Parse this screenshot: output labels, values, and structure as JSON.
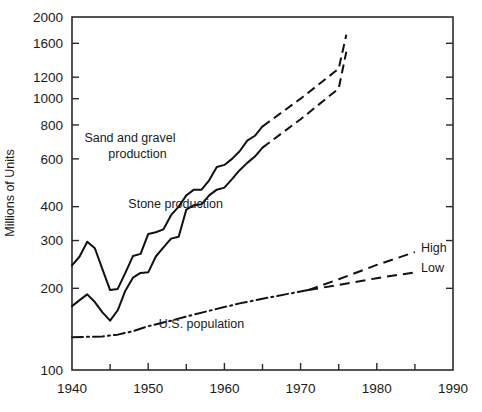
{
  "chart_data": {
    "type": "line",
    "title": "",
    "xlabel": "",
    "ylabel": "Millions of Units",
    "xlim": [
      1940,
      1990
    ],
    "ylim": [
      100,
      2000
    ],
    "yscale": "log",
    "grid": false,
    "legend_position": "inline-annotations",
    "x_ticks_major": [
      1940,
      1950,
      1960,
      1970,
      1980,
      1990
    ],
    "x_ticks_minor": [
      1945,
      1955,
      1965,
      1975,
      1985
    ],
    "x_tick_labels": [
      "1940",
      "1950",
      "1960",
      "1970",
      "1980",
      "1990"
    ],
    "y_ticks": [
      100,
      200,
      300,
      400,
      600,
      800,
      1000,
      1200,
      1600,
      2000
    ],
    "y_tick_labels": [
      "100",
      "200",
      "300",
      "400",
      "600",
      "800",
      "1000",
      "1200",
      "1600",
      "2000"
    ],
    "annotations": [
      {
        "text": "Sand and gravel",
        "x": 1947.6,
        "y": 690,
        "name": "sand-gravel-label-line1"
      },
      {
        "text": "production",
        "x": 1948.6,
        "y": 605,
        "name": "sand-gravel-label-line2"
      },
      {
        "text": "Stone production",
        "x": 1953.6,
        "y": 395,
        "name": "stone-label"
      },
      {
        "text": "U.S. population",
        "x": 1957.0,
        "y": 143,
        "name": "population-label"
      },
      {
        "text": "High",
        "x": 1985.8,
        "y": 272,
        "name": "high-label"
      },
      {
        "text": "Low",
        "x": 1985.8,
        "y": 229,
        "name": "low-label"
      }
    ],
    "series": [
      {
        "name": "Sand and gravel production",
        "style": "solid-then-dashed",
        "historical": [
          [
            1940,
            243
          ],
          [
            1941,
            262
          ],
          [
            1942,
            297
          ],
          [
            1943,
            281
          ],
          [
            1944,
            235
          ],
          [
            1945,
            197
          ],
          [
            1946,
            199
          ],
          [
            1947,
            228
          ],
          [
            1948,
            263
          ],
          [
            1949,
            268
          ],
          [
            1950,
            317
          ],
          [
            1951,
            322
          ],
          [
            1952,
            330
          ],
          [
            1953,
            372
          ],
          [
            1954,
            400
          ],
          [
            1955,
            440
          ],
          [
            1956,
            462
          ],
          [
            1957,
            462
          ],
          [
            1958,
            500
          ],
          [
            1959,
            560
          ],
          [
            1960,
            570
          ],
          [
            1961,
            600
          ],
          [
            1962,
            640
          ],
          [
            1963,
            700
          ],
          [
            1964,
            730
          ],
          [
            1965,
            790
          ]
        ],
        "projection": [
          [
            1965,
            790
          ],
          [
            1970,
            1000
          ],
          [
            1975,
            1290
          ],
          [
            1976,
            1720
          ]
        ]
      },
      {
        "name": "Stone production",
        "style": "solid-then-dashed",
        "historical": [
          [
            1940,
            172
          ],
          [
            1941,
            181
          ],
          [
            1942,
            190
          ],
          [
            1943,
            178
          ],
          [
            1944,
            163
          ],
          [
            1945,
            152
          ],
          [
            1946,
            166
          ],
          [
            1947,
            196
          ],
          [
            1948,
            219
          ],
          [
            1949,
            228
          ],
          [
            1950,
            229
          ],
          [
            1951,
            262
          ],
          [
            1952,
            283
          ],
          [
            1953,
            305
          ],
          [
            1954,
            310
          ],
          [
            1955,
            390
          ],
          [
            1956,
            405
          ],
          [
            1957,
            408
          ],
          [
            1958,
            440
          ],
          [
            1959,
            462
          ],
          [
            1960,
            470
          ],
          [
            1961,
            505
          ],
          [
            1962,
            545
          ],
          [
            1963,
            580
          ],
          [
            1964,
            612
          ],
          [
            1965,
            660
          ]
        ],
        "projection": [
          [
            1965,
            660
          ],
          [
            1970,
            840
          ],
          [
            1975,
            1090
          ],
          [
            1976,
            1490
          ]
        ]
      },
      {
        "name": "U.S. population",
        "style": "dash-dot-then-dashed",
        "historical": [
          [
            1940,
            132
          ],
          [
            1944,
            133
          ],
          [
            1946,
            135
          ],
          [
            1948,
            139
          ],
          [
            1950,
            145
          ],
          [
            1953,
            152
          ],
          [
            1956,
            160
          ],
          [
            1959,
            168
          ],
          [
            1962,
            176
          ],
          [
            1965,
            183
          ],
          [
            1968,
            190
          ],
          [
            1971,
            197
          ]
        ],
        "projection_high": [
          [
            1971,
            197
          ],
          [
            1975,
            216
          ],
          [
            1980,
            244
          ],
          [
            1985,
            272
          ]
        ],
        "projection_low": [
          [
            1971,
            197
          ],
          [
            1975,
            206
          ],
          [
            1980,
            218
          ],
          [
            1985,
            229
          ]
        ]
      }
    ]
  }
}
